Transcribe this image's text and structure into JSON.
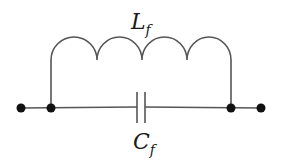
{
  "diagram": {
    "type": "circuit-schematic",
    "colors": {
      "line": "#555555",
      "node": "#111111",
      "background": "#ffffff"
    },
    "components": [
      {
        "id": "inductor",
        "kind": "inductor",
        "label_main": "L",
        "label_sub": "f",
        "turns": 4
      },
      {
        "id": "capacitor",
        "kind": "capacitor",
        "label_main": "C",
        "label_sub": "f"
      }
    ],
    "nodes": [
      {
        "id": "terminal-left",
        "x": 21,
        "y": 108
      },
      {
        "id": "junction-left",
        "x": 51,
        "y": 108
      },
      {
        "id": "junction-right",
        "x": 231,
        "y": 108
      },
      {
        "id": "terminal-right",
        "x": 261,
        "y": 108
      }
    ]
  }
}
